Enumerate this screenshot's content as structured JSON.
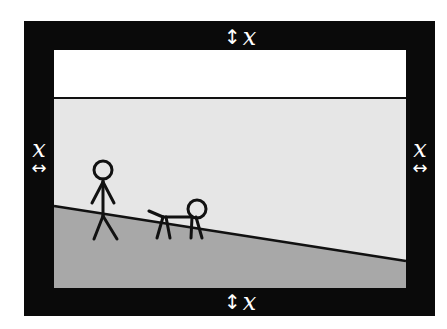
{
  "diagram": {
    "colors": {
      "frame": "#0a0a0a",
      "sky": "#ffffff",
      "wall": "#e6e6e6",
      "ground": "#a8a8a8",
      "stroke": "#111111",
      "label": "#ffffff"
    },
    "labels": {
      "top": {
        "arrow": "↕",
        "text": "x"
      },
      "bottom": {
        "arrow": "↕",
        "text": "x"
      },
      "left": {
        "arrow": "↔",
        "text": "x"
      },
      "right": {
        "arrow": "↔",
        "text": "x"
      }
    },
    "figures": [
      {
        "type": "person"
      },
      {
        "type": "dog"
      }
    ]
  }
}
